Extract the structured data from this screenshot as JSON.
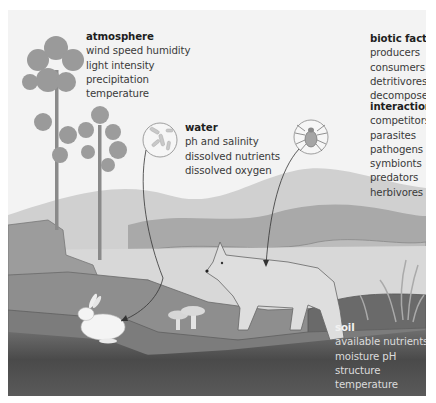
{
  "diagram": {
    "palette": {
      "sky": "#f3f3f3",
      "far_hill": "#c9c9c9",
      "mid_hill": "#a9a9a9",
      "meadow": "#bdbdbd",
      "ground": "#8f8f8f",
      "soil_dark": "#3c3c3c",
      "animal_fill": "#e4e4e4",
      "outline": "#555555"
    },
    "groups": {
      "atmosphere": {
        "title": "atmosphere",
        "items": [
          "wind speed  humidity",
          "light intensity",
          "precipitation",
          "temperature"
        ]
      },
      "water": {
        "title": "water",
        "items": [
          "ph and salinity",
          "dissolved nutrients",
          "dissolved oxygen"
        ]
      },
      "biotic_factors": {
        "title": "biotic factors",
        "items": [
          "producers",
          "consumers",
          "detritivores",
          "decomposers"
        ]
      },
      "interactions": {
        "title": "interactions",
        "items": [
          "competitors",
          "parasites",
          "pathogens",
          "symbionts",
          "predators",
          "herbivores"
        ]
      },
      "soil": {
        "title": "soil",
        "items": [
          "available nutrients",
          "moisture pH",
          "structure",
          "temperature"
        ]
      }
    },
    "callouts": [
      {
        "icon": "bacteria-icon",
        "points_to": "rabbit"
      },
      {
        "icon": "tick-icon",
        "points_to": "fox"
      }
    ],
    "illustration_elements": [
      "trees",
      "hills",
      "rabbit",
      "fox",
      "mushrooms",
      "reeds"
    ]
  }
}
